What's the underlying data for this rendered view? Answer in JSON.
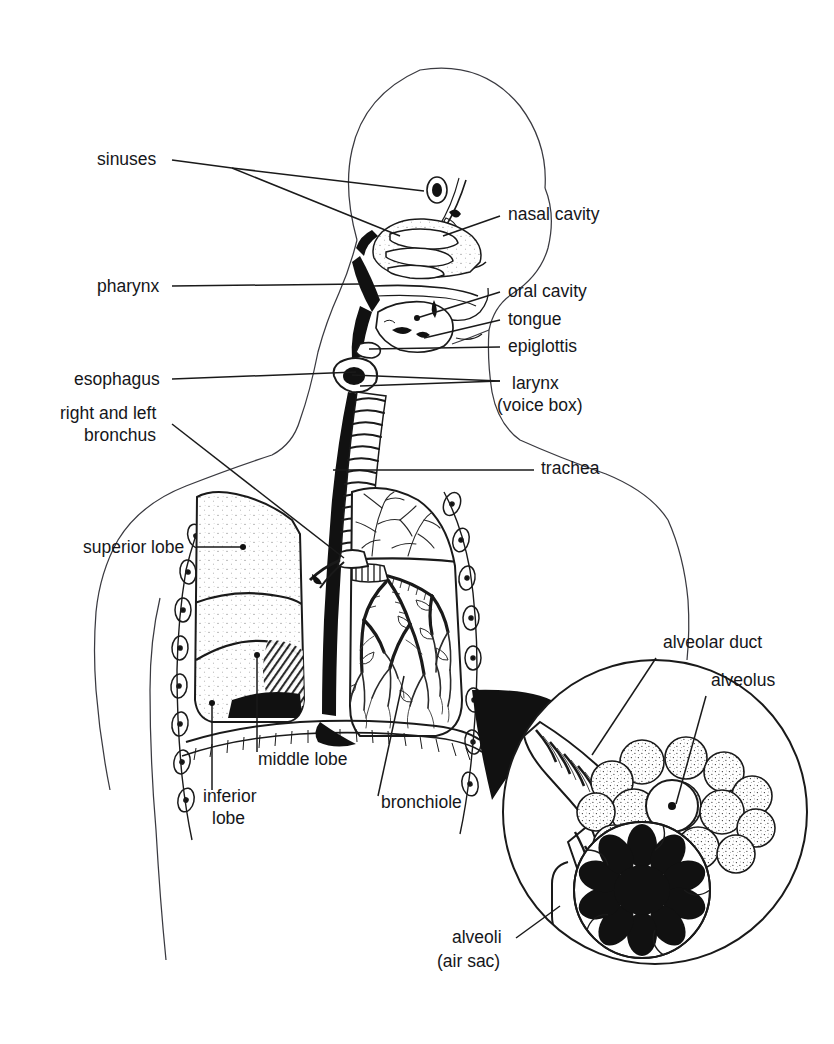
{
  "figure": {
    "style": "black-and-white line drawing, sagittal section of head, neck and thorax with magnified alveoli inset",
    "background_color": "#ffffff",
    "ink_color": "#15161a",
    "width": 834,
    "height": 1044
  },
  "labels": {
    "sinuses": "sinuses",
    "pharynx": "pharynx",
    "esophagus": "esophagus",
    "bronchus_line1": "right and left",
    "bronchus_line2": "bronchus",
    "superior_lobe": "superior lobe",
    "inferior_lobe_line1": "inferior",
    "inferior_lobe_line2": "lobe",
    "middle_lobe": "middle lobe",
    "bronchiole": "bronchiole",
    "nasal_cavity": "nasal cavity",
    "oral_cavity": "oral cavity",
    "tongue": "tongue",
    "epiglottis": "epiglottis",
    "larynx_line1": "larynx",
    "larynx_line2": "(voice box)",
    "trachea": "trachea",
    "alveolar_duct": "alveolar duct",
    "alveolus": "alveolus",
    "alveoli_line1": "alveoli",
    "alveoli_line2": "(air sac)"
  },
  "parts": [
    {
      "name": "sinuses",
      "side": "left",
      "label_xy": [
        97,
        165
      ],
      "target_xy": [
        424,
        191
      ]
    },
    {
      "name": "pharynx",
      "side": "left",
      "label_xy": [
        97,
        292
      ],
      "target_xy": [
        360,
        284
      ]
    },
    {
      "name": "esophagus",
      "side": "left",
      "label_xy": [
        74,
        385
      ],
      "target_xy": [
        356,
        372
      ]
    },
    {
      "name": "right-and-left-bronchus",
      "side": "left",
      "label_xy": [
        60,
        419
      ],
      "target_xy": [
        344,
        558
      ]
    },
    {
      "name": "superior-lobe",
      "side": "left",
      "label_xy": [
        83,
        553
      ],
      "target_xy": [
        243,
        547
      ]
    },
    {
      "name": "inferior-lobe",
      "side": "left",
      "label_xy": [
        203,
        802
      ],
      "target_xy": [
        212,
        703
      ]
    },
    {
      "name": "middle-lobe",
      "side": "left",
      "label_xy": [
        258,
        765
      ],
      "target_xy": [
        257,
        655
      ]
    },
    {
      "name": "bronchiole",
      "side": "left",
      "label_xy": [
        381,
        808
      ],
      "target_xy": [
        404,
        676
      ]
    },
    {
      "name": "nasal-cavity",
      "side": "right",
      "label_xy": [
        508,
        220
      ],
      "target_xy": [
        443,
        236
      ]
    },
    {
      "name": "oral-cavity",
      "side": "right",
      "label_xy": [
        508,
        297
      ],
      "target_xy": [
        417,
        318
      ]
    },
    {
      "name": "tongue",
      "side": "right",
      "label_xy": [
        508,
        325
      ],
      "target_xy": [
        424,
        338
      ]
    },
    {
      "name": "epiglottis",
      "side": "right",
      "label_xy": [
        508,
        352
      ],
      "target_xy": [
        369,
        349
      ]
    },
    {
      "name": "larynx",
      "side": "right",
      "label_xy": [
        512,
        389
      ],
      "target_xy": [
        352,
        378
      ]
    },
    {
      "name": "trachea",
      "side": "right",
      "label_xy": [
        541,
        474
      ],
      "target_xy": [
        333,
        470
      ]
    },
    {
      "name": "alveolar-duct",
      "side": "right",
      "label_xy": [
        663,
        648
      ],
      "target_xy": [
        592,
        755
      ]
    },
    {
      "name": "alveolus",
      "side": "right",
      "label_xy": [
        711,
        686
      ],
      "target_xy": [
        685,
        805
      ]
    },
    {
      "name": "alveoli-air-sac",
      "side": "left",
      "label_xy": [
        452,
        943
      ],
      "target_xy": [
        560,
        905
      ]
    }
  ],
  "inset": {
    "shape": "circle",
    "center_xy": [
      655,
      812
    ],
    "radius": 152,
    "contents": [
      "alveolar duct",
      "alveolus cluster",
      "alveoli air sac rosette"
    ],
    "pointer": "black triangular wedge from right lung"
  }
}
